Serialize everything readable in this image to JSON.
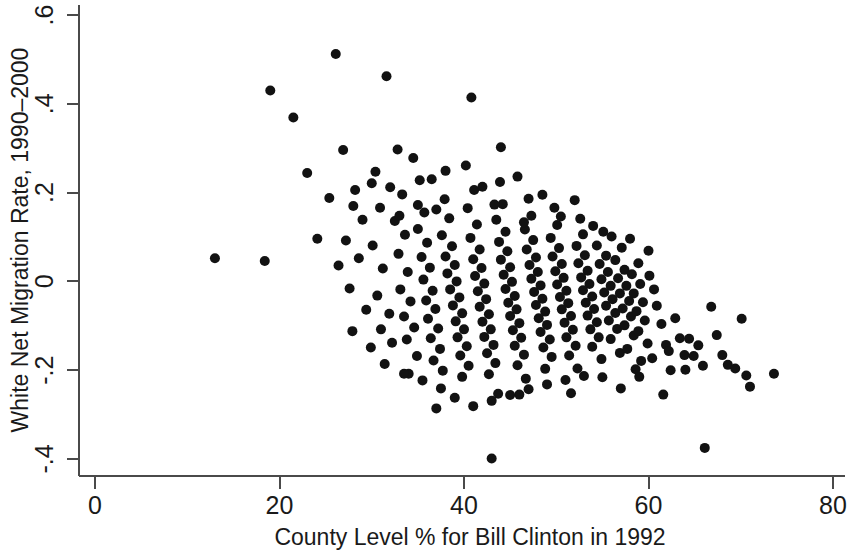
{
  "chart_data": {
    "type": "scatter",
    "title": "",
    "xlabel": "County Level % for Bill Clinton in 1992",
    "ylabel": "White Net Migration Rate, 1990–2000",
    "xlim": [
      0,
      80
    ],
    "ylim": [
      -0.4,
      0.6
    ],
    "xticks": [
      0,
      20,
      40,
      60,
      80
    ],
    "xticklabels": [
      "0",
      "20",
      "40",
      "60",
      "80"
    ],
    "yticks": [
      -0.4,
      -0.2,
      0,
      0.2,
      0.4,
      0.6
    ],
    "yticklabels": [
      "-.4",
      "-.2",
      "0",
      ".2",
      ".4",
      ".6"
    ],
    "grid": false,
    "legend": null,
    "marker": {
      "shape": "circle",
      "color": "#121212",
      "size_px": 10
    },
    "n_points": 278,
    "series": [
      {
        "name": "counties",
        "points": [
          [
            13.0,
            0.052
          ],
          [
            18.4,
            0.046
          ],
          [
            19.0,
            0.43
          ],
          [
            21.5,
            0.369
          ],
          [
            23.0,
            0.244
          ],
          [
            24.1,
            0.096
          ],
          [
            26.1,
            0.512
          ],
          [
            26.9,
            0.296
          ],
          [
            25.4,
            0.188
          ],
          [
            27.2,
            0.092
          ],
          [
            26.4,
            0.036
          ],
          [
            27.6,
            -0.016
          ],
          [
            28.2,
            0.206
          ],
          [
            29.0,
            0.139
          ],
          [
            28.6,
            0.052
          ],
          [
            29.4,
            -0.064
          ],
          [
            27.9,
            -0.112
          ],
          [
            29.9,
            -0.149
          ],
          [
            30.4,
            0.247
          ],
          [
            30.9,
            0.166
          ],
          [
            31.6,
            0.462
          ],
          [
            30.1,
            0.081
          ],
          [
            31.2,
            0.029
          ],
          [
            30.6,
            -0.032
          ],
          [
            31.9,
            -0.073
          ],
          [
            31.0,
            -0.108
          ],
          [
            32.2,
            -0.138
          ],
          [
            31.4,
            -0.186
          ],
          [
            32.8,
            0.297
          ],
          [
            33.3,
            0.196
          ],
          [
            32.5,
            0.136
          ],
          [
            33.6,
            0.105
          ],
          [
            32.9,
            0.062
          ],
          [
            33.9,
            0.021
          ],
          [
            33.1,
            -0.018
          ],
          [
            34.2,
            -0.045
          ],
          [
            33.5,
            -0.079
          ],
          [
            34.6,
            -0.104
          ],
          [
            33.8,
            -0.131
          ],
          [
            34.9,
            -0.168
          ],
          [
            34.0,
            -0.208
          ],
          [
            35.2,
            0.228
          ],
          [
            35.7,
            0.155
          ],
          [
            35.0,
            0.118
          ],
          [
            36.0,
            0.087
          ],
          [
            35.4,
            0.055
          ],
          [
            36.3,
            0.031
          ],
          [
            35.6,
            0.004
          ],
          [
            36.6,
            -0.021
          ],
          [
            35.9,
            -0.043
          ],
          [
            36.9,
            -0.062
          ],
          [
            36.1,
            -0.084
          ],
          [
            37.2,
            -0.106
          ],
          [
            36.4,
            -0.128
          ],
          [
            37.4,
            -0.152
          ],
          [
            36.7,
            -0.178
          ],
          [
            37.7,
            -0.201
          ],
          [
            37.0,
            -0.286
          ],
          [
            37.9,
            0.185
          ],
          [
            38.4,
            0.142
          ],
          [
            37.6,
            0.104
          ],
          [
            38.7,
            0.079
          ],
          [
            38.0,
            0.056
          ],
          [
            39.0,
            0.037
          ],
          [
            38.2,
            0.018
          ],
          [
            39.2,
            0.0
          ],
          [
            38.5,
            -0.018
          ],
          [
            39.5,
            -0.036
          ],
          [
            38.8,
            -0.054
          ],
          [
            39.8,
            -0.072
          ],
          [
            39.1,
            -0.09
          ],
          [
            40.0,
            -0.108
          ],
          [
            39.3,
            -0.126
          ],
          [
            40.3,
            -0.146
          ],
          [
            39.6,
            -0.167
          ],
          [
            40.5,
            -0.19
          ],
          [
            39.8,
            -0.215
          ],
          [
            40.8,
            0.414
          ],
          [
            41.1,
            0.206
          ],
          [
            40.4,
            0.165
          ],
          [
            41.4,
            0.128
          ],
          [
            40.7,
            0.098
          ],
          [
            41.7,
            0.072
          ],
          [
            41.0,
            0.05
          ],
          [
            41.9,
            0.03
          ],
          [
            41.2,
            0.012
          ],
          [
            42.2,
            -0.005
          ],
          [
            41.5,
            -0.022
          ],
          [
            42.4,
            -0.04
          ],
          [
            41.7,
            -0.057
          ],
          [
            42.7,
            -0.074
          ],
          [
            42.0,
            -0.091
          ],
          [
            42.9,
            -0.108
          ],
          [
            42.2,
            -0.125
          ],
          [
            43.2,
            -0.143
          ],
          [
            42.5,
            -0.162
          ],
          [
            43.4,
            -0.184
          ],
          [
            42.7,
            -0.209
          ],
          [
            43.7,
            -0.253
          ],
          [
            43.0,
            -0.399
          ],
          [
            43.9,
            0.224
          ],
          [
            44.2,
            0.174
          ],
          [
            43.5,
            0.139
          ],
          [
            44.5,
            0.112
          ],
          [
            43.8,
            0.089
          ],
          [
            44.7,
            0.068
          ],
          [
            44.0,
            0.049
          ],
          [
            45.0,
            0.032
          ],
          [
            44.3,
            0.015
          ],
          [
            45.2,
            -0.001
          ],
          [
            44.5,
            -0.017
          ],
          [
            45.5,
            -0.033
          ],
          [
            44.8,
            -0.048
          ],
          [
            45.7,
            -0.063
          ],
          [
            45.0,
            -0.078
          ],
          [
            46.0,
            -0.094
          ],
          [
            45.3,
            -0.11
          ],
          [
            46.2,
            -0.127
          ],
          [
            45.5,
            -0.145
          ],
          [
            46.5,
            -0.165
          ],
          [
            45.8,
            -0.189
          ],
          [
            46.7,
            -0.219
          ],
          [
            46.0,
            -0.255
          ],
          [
            47.0,
            0.186
          ],
          [
            47.3,
            0.148
          ],
          [
            46.6,
            0.117
          ],
          [
            47.5,
            0.093
          ],
          [
            46.8,
            0.072
          ],
          [
            47.8,
            0.054
          ],
          [
            47.1,
            0.037
          ],
          [
            48.0,
            0.021
          ],
          [
            47.3,
            0.006
          ],
          [
            48.3,
            -0.009
          ],
          [
            47.6,
            -0.024
          ],
          [
            48.5,
            -0.039
          ],
          [
            47.8,
            -0.053
          ],
          [
            48.8,
            -0.068
          ],
          [
            48.1,
            -0.083
          ],
          [
            49.0,
            -0.098
          ],
          [
            48.3,
            -0.114
          ],
          [
            49.3,
            -0.131
          ],
          [
            48.6,
            -0.149
          ],
          [
            49.5,
            -0.17
          ],
          [
            48.8,
            -0.197
          ],
          [
            49.8,
            0.166
          ],
          [
            50.1,
            0.127
          ],
          [
            49.4,
            0.098
          ],
          [
            50.3,
            0.075
          ],
          [
            49.6,
            0.056
          ],
          [
            50.6,
            0.039
          ],
          [
            49.9,
            0.023
          ],
          [
            50.8,
            0.008
          ],
          [
            50.1,
            -0.007
          ],
          [
            51.1,
            -0.021
          ],
          [
            50.4,
            -0.035
          ],
          [
            51.3,
            -0.049
          ],
          [
            50.6,
            -0.063
          ],
          [
            51.6,
            -0.078
          ],
          [
            50.9,
            -0.093
          ],
          [
            51.8,
            -0.109
          ],
          [
            51.1,
            -0.126
          ],
          [
            52.1,
            -0.145
          ],
          [
            51.4,
            -0.167
          ],
          [
            52.3,
            -0.196
          ],
          [
            51.6,
            -0.252
          ],
          [
            52.6,
            0.141
          ],
          [
            52.9,
            0.106
          ],
          [
            52.2,
            0.08
          ],
          [
            53.1,
            0.059
          ],
          [
            52.4,
            0.041
          ],
          [
            53.4,
            0.024
          ],
          [
            52.7,
            0.009
          ],
          [
            53.6,
            -0.006
          ],
          [
            52.9,
            -0.02
          ],
          [
            53.9,
            -0.034
          ],
          [
            53.2,
            -0.048
          ],
          [
            54.1,
            -0.062
          ],
          [
            53.4,
            -0.077
          ],
          [
            54.4,
            -0.092
          ],
          [
            53.7,
            -0.108
          ],
          [
            54.6,
            -0.126
          ],
          [
            53.9,
            -0.147
          ],
          [
            54.9,
            -0.175
          ],
          [
            55.1,
            0.112
          ],
          [
            54.4,
            0.081
          ],
          [
            55.4,
            0.058
          ],
          [
            54.7,
            0.039
          ],
          [
            55.6,
            0.021
          ],
          [
            54.9,
            0.005
          ],
          [
            55.9,
            -0.01
          ],
          [
            55.2,
            -0.025
          ],
          [
            56.1,
            -0.04
          ],
          [
            55.4,
            -0.055
          ],
          [
            56.4,
            -0.071
          ],
          [
            55.7,
            -0.088
          ],
          [
            56.6,
            -0.107
          ],
          [
            55.9,
            -0.13
          ],
          [
            56.9,
            -0.161
          ],
          [
            57.1,
            0.076
          ],
          [
            56.4,
            0.048
          ],
          [
            57.4,
            0.026
          ],
          [
            56.7,
            0.007
          ],
          [
            57.6,
            -0.01
          ],
          [
            56.9,
            -0.027
          ],
          [
            57.9,
            -0.044
          ],
          [
            57.2,
            -0.061
          ],
          [
            58.1,
            -0.079
          ],
          [
            57.4,
            -0.099
          ],
          [
            58.4,
            -0.122
          ],
          [
            57.7,
            -0.152
          ],
          [
            58.6,
            -0.198
          ],
          [
            58.9,
            0.041
          ],
          [
            58.2,
            0.016
          ],
          [
            59.1,
            -0.006
          ],
          [
            58.4,
            -0.027
          ],
          [
            59.4,
            -0.047
          ],
          [
            58.7,
            -0.067
          ],
          [
            59.6,
            -0.088
          ],
          [
            58.9,
            -0.112
          ],
          [
            59.9,
            -0.14
          ],
          [
            59.2,
            -0.179
          ],
          [
            60.1,
            0.013
          ],
          [
            60.6,
            -0.018
          ],
          [
            60.9,
            -0.055
          ],
          [
            61.4,
            -0.096
          ],
          [
            61.9,
            -0.143
          ],
          [
            62.4,
            -0.2
          ],
          [
            62.9,
            -0.083
          ],
          [
            63.4,
            -0.128
          ],
          [
            63.9,
            -0.166
          ],
          [
            64.4,
            -0.129
          ],
          [
            64.9,
            -0.168
          ],
          [
            65.4,
            -0.144
          ],
          [
            65.9,
            -0.19
          ],
          [
            66.1,
            -0.375
          ],
          [
            61.6,
            -0.255
          ],
          [
            66.8,
            -0.057
          ],
          [
            67.4,
            -0.121
          ],
          [
            68.0,
            -0.166
          ],
          [
            68.6,
            -0.188
          ],
          [
            69.4,
            -0.196
          ],
          [
            70.1,
            -0.084
          ],
          [
            70.6,
            -0.212
          ],
          [
            71.0,
            -0.237
          ],
          [
            73.6,
            -0.208
          ],
          [
            64.0,
            -0.199
          ],
          [
            62.2,
            -0.157
          ],
          [
            60.4,
            -0.173
          ],
          [
            59.0,
            -0.215
          ],
          [
            57.0,
            -0.241
          ],
          [
            55.0,
            -0.216
          ],
          [
            53.0,
            -0.213
          ],
          [
            51.0,
            -0.222
          ],
          [
            49.0,
            -0.232
          ],
          [
            47.0,
            -0.243
          ],
          [
            45.0,
            -0.256
          ],
          [
            43.0,
            -0.269
          ],
          [
            41.0,
            -0.281
          ],
          [
            39.0,
            -0.262
          ],
          [
            37.5,
            -0.241
          ],
          [
            35.5,
            -0.223
          ],
          [
            33.5,
            -0.208
          ],
          [
            40.2,
            0.261
          ],
          [
            43.3,
            0.173
          ],
          [
            45.8,
            0.236
          ],
          [
            48.5,
            0.195
          ],
          [
            50.5,
            0.146
          ],
          [
            52.0,
            0.183
          ],
          [
            44.0,
            0.302
          ],
          [
            38.0,
            0.249
          ],
          [
            34.5,
            0.278
          ],
          [
            36.5,
            0.23
          ],
          [
            42.0,
            0.213
          ],
          [
            46.5,
            0.133
          ],
          [
            54.0,
            0.125
          ],
          [
            56.0,
            0.101
          ],
          [
            58.0,
            0.096
          ],
          [
            60.0,
            0.069
          ],
          [
            32.0,
            0.212
          ],
          [
            30.0,
            0.221
          ],
          [
            28.0,
            0.17
          ],
          [
            33.0,
            0.148
          ],
          [
            35.0,
            0.172
          ],
          [
            37.0,
            0.162
          ]
        ]
      }
    ]
  },
  "axes": {
    "x": {
      "title": "County Level % for Bill Clinton in 1992",
      "labels": [
        "0",
        "20",
        "40",
        "60",
        "80"
      ]
    },
    "y": {
      "title": "White Net Migration Rate, 1990–2000",
      "labels": [
        ".6",
        ".4",
        ".2",
        "0",
        "-.2",
        "-.4"
      ]
    }
  }
}
